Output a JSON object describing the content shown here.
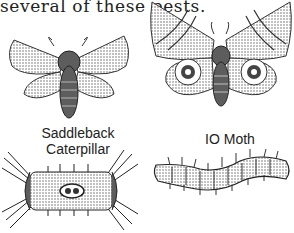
{
  "text": {
    "intro_line": "several of these pests."
  },
  "figures": [
    {
      "name": "saddleback-moth",
      "label_lines": [
        "Saddleback",
        "Caterpillar"
      ]
    },
    {
      "name": "io-moth",
      "label": "IO Moth"
    },
    {
      "name": "saddleback-caterpillar"
    },
    {
      "name": "io-caterpillar"
    }
  ],
  "colors": {
    "ink": "#222222",
    "paper": "#ffffff"
  }
}
